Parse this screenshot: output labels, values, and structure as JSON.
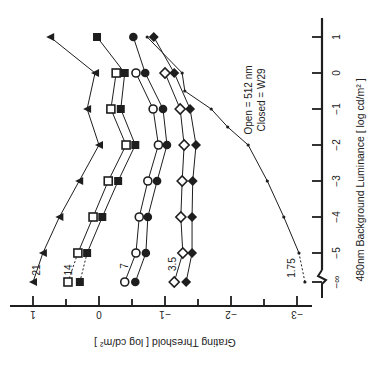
{
  "chart_data": {
    "type": "line",
    "orientation": "rotated 90 degrees counter-clockwise (x-axis vertical on right, y-axis horizontal at bottom)",
    "title": "",
    "xlabel": "480nm Background Luminance [ log cd/m² ]",
    "ylabel": "Grating Threshold [ log cd/m² ]",
    "x_ticks": [
      "−∞",
      "−5",
      "−4",
      "−3",
      "−2",
      "−1",
      "0",
      "1"
    ],
    "y_ticks": [
      "1",
      "0",
      "−1",
      "−2",
      "−3"
    ],
    "ylim": [
      -3.2,
      1.1
    ],
    "legend_annotation": [
      "Open = 512 nm",
      "Closed = W29"
    ],
    "x": [
      "-inf",
      -5,
      -4,
      -3,
      -2,
      -1,
      0,
      1
    ],
    "series": [
      {
        "name": "21",
        "marker": "triangle",
        "label": "21",
        "values": [
          1.0,
          0.85,
          0.6,
          0.3,
          0.0,
          0.18,
          0.06,
          0.74
        ]
      },
      {
        "name": "14 open",
        "marker": "square-open",
        "label": "14",
        "values": [
          0.47,
          0.32,
          0.09,
          -0.14,
          -0.41,
          -0.18,
          -0.26,
          null
        ]
      },
      {
        "name": "14 closed",
        "marker": "square-filled",
        "label": "14",
        "values": [
          0.29,
          0.18,
          -0.05,
          -0.29,
          -0.55,
          -0.33,
          -0.39,
          0.03
        ]
      },
      {
        "name": "7 open",
        "marker": "circle-open",
        "label": "7",
        "values": [
          -0.39,
          -0.56,
          -0.61,
          -0.74,
          -0.9,
          -0.82,
          -0.56,
          null
        ]
      },
      {
        "name": "7 closed",
        "marker": "circle-filled",
        "label": "7",
        "values": [
          -0.55,
          -0.71,
          -0.74,
          -0.88,
          -1.03,
          -0.97,
          -0.7,
          -0.52
        ]
      },
      {
        "name": "3.5 open",
        "marker": "diamond-open",
        "label": "3.5",
        "values": [
          -1.14,
          -1.27,
          -1.24,
          -1.26,
          -1.29,
          -1.23,
          -1.0,
          null
        ]
      },
      {
        "name": "3.5 closed",
        "marker": "diamond-filled",
        "label": "3.5",
        "values": [
          -1.32,
          -1.41,
          -1.41,
          -1.42,
          -1.47,
          -1.38,
          -1.14,
          -0.83
        ]
      },
      {
        "name": "1.75",
        "marker": "dot",
        "label": "1.75",
        "x": [
          "-inf",
          -5,
          -4,
          -3,
          -2,
          -1.5,
          -1,
          -0.5,
          0,
          1
        ],
        "values": [
          -3.12,
          -3.03,
          -2.8,
          -2.55,
          -2.26,
          -1.95,
          -1.7,
          -1.3,
          -1.26,
          -0.73
        ]
      }
    ],
    "series_labels": [
      "21",
      "14",
      "7",
      "3.5",
      "1.75"
    ],
    "grid": false
  },
  "axes": {
    "lum_label": "480nm Background Luminance [ log cd/m² ]",
    "thr_label": "Grating Threshold [ log cd/m² ]",
    "legend_open": "Open = 512 nm",
    "legend_closed": "Closed = W29"
  }
}
